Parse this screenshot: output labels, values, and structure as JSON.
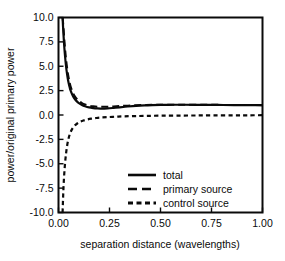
{
  "chart_data": {
    "type": "line",
    "title": "",
    "xlabel": "separation distance (wavelengths)",
    "ylabel": "power/original primary power",
    "xlim": [
      0.0,
      1.0
    ],
    "ylim": [
      -10.0,
      10.0
    ],
    "xticks": [
      0.0,
      0.25,
      0.5,
      0.75,
      1.0
    ],
    "xticklabels": [
      "0.00",
      "0.25",
      "0.50",
      "0.75",
      "1.00"
    ],
    "yticks": [
      -10.0,
      -7.5,
      -5.0,
      -2.5,
      0.0,
      2.5,
      5.0,
      7.5,
      10.0
    ],
    "yticklabels": [
      "-10.0",
      "-7.5",
      "-5.0",
      "-2.5",
      "0.0",
      "2.5",
      "5.0",
      "7.5",
      "10.0"
    ],
    "grid": false,
    "legend_position": "lower center",
    "series": [
      {
        "name": "total",
        "style": "solid",
        "x": [
          0.02,
          0.024,
          0.028,
          0.032,
          0.036,
          0.04,
          0.045,
          0.05,
          0.055,
          0.06,
          0.07,
          0.08,
          0.09,
          0.1,
          0.115,
          0.13,
          0.15,
          0.17,
          0.19,
          0.21,
          0.24,
          0.27,
          0.3,
          0.34,
          0.38,
          0.42,
          0.46,
          0.5,
          0.56,
          0.62,
          0.7,
          0.78,
          0.86,
          0.93,
          1.0
        ],
        "y": [
          10.0,
          8.4,
          7.1,
          6.05,
          5.2,
          4.5,
          3.8,
          3.25,
          2.82,
          2.48,
          1.98,
          1.64,
          1.4,
          1.22,
          1.03,
          0.9,
          0.78,
          0.71,
          0.67,
          0.66,
          0.68,
          0.73,
          0.79,
          0.87,
          0.94,
          0.99,
          1.02,
          1.04,
          1.05,
          1.05,
          1.04,
          1.03,
          1.02,
          1.01,
          1.01
        ]
      },
      {
        "name": "primary source",
        "style": "long-dash",
        "x": [
          0.02,
          0.024,
          0.028,
          0.032,
          0.036,
          0.04,
          0.045,
          0.05,
          0.055,
          0.06,
          0.07,
          0.08,
          0.09,
          0.1,
          0.115,
          0.13,
          0.15,
          0.17,
          0.19,
          0.21,
          0.24,
          0.27,
          0.3,
          0.34,
          0.38,
          0.42,
          0.46,
          0.5,
          0.56,
          0.62,
          0.7,
          0.78,
          0.86,
          0.93,
          1.0
        ],
        "y": [
          10.0,
          9.1,
          7.9,
          6.85,
          5.95,
          5.2,
          4.42,
          3.8,
          3.3,
          2.9,
          2.32,
          1.92,
          1.64,
          1.44,
          1.23,
          1.09,
          0.96,
          0.89,
          0.85,
          0.84,
          0.85,
          0.88,
          0.92,
          0.96,
          1.0,
          1.02,
          1.04,
          1.05,
          1.06,
          1.06,
          1.05,
          1.04,
          1.03,
          1.02,
          1.01
        ]
      },
      {
        "name": "control source",
        "style": "short-dash",
        "x": [
          0.02,
          0.023,
          0.026,
          0.03,
          0.034,
          0.038,
          0.043,
          0.048,
          0.054,
          0.06,
          0.068,
          0.076,
          0.085,
          0.095,
          0.108,
          0.122,
          0.14,
          0.16,
          0.185,
          0.21,
          0.24,
          0.28,
          0.32,
          0.37,
          0.43,
          0.5,
          0.58,
          0.67,
          0.76,
          0.86,
          0.93,
          1.0
        ],
        "y": [
          -10.0,
          -8.2,
          -6.8,
          -5.5,
          -4.52,
          -3.78,
          -3.05,
          -2.52,
          -2.05,
          -1.72,
          -1.4,
          -1.17,
          -0.98,
          -0.82,
          -0.67,
          -0.56,
          -0.46,
          -0.38,
          -0.31,
          -0.26,
          -0.22,
          -0.17,
          -0.14,
          -0.11,
          -0.09,
          -0.07,
          -0.06,
          -0.05,
          -0.04,
          -0.03,
          -0.03,
          -0.02
        ]
      }
    ],
    "legend_entries": [
      {
        "label": "total",
        "style": "solid"
      },
      {
        "label": "primary source",
        "style": "long-dash"
      },
      {
        "label": "control source",
        "style": "short-dash"
      }
    ],
    "colors": {
      "line": "#0a0a0a",
      "background": "#ffffff"
    }
  }
}
